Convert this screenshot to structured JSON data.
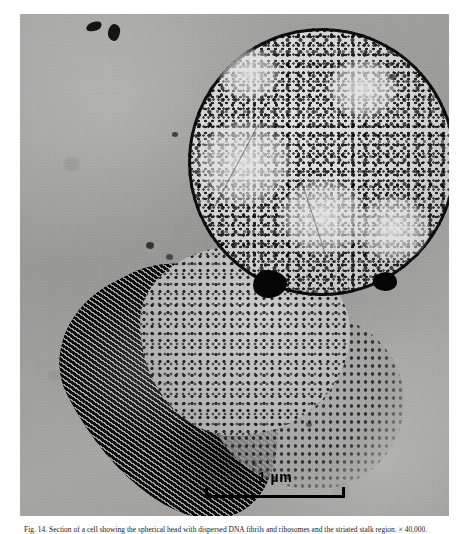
{
  "figure": {
    "kind": "transmission-electron-micrograph",
    "specimen": "thin-sectioned bacterial cell with spherical head and elongated stalk",
    "background_tone": "#9b9b99",
    "membrane_color": "#111111",
    "inclusion_color": "#0a0a0a"
  },
  "scale_bar": {
    "label": "1 µm",
    "value": 1,
    "unit": "µm",
    "length_px": 140,
    "position": "bottom-center"
  },
  "caption": {
    "visible": true,
    "clipped": true,
    "note": "caption line is cut off by the bottom edge of the image; only the tops of the glyphs are rendered",
    "text": "Fig. 14. Section of a cell showing the spherical head with dispersed DNA fibrils and ribosomes and the striated stalk region.  × 40,000.",
    "fig_number": "Fig. 14."
  },
  "debris": [
    {
      "name": "fleck-upper-left-a",
      "x": 66,
      "y": 8,
      "w": 16,
      "h": 9
    },
    {
      "name": "fleck-upper-left-b",
      "x": 88,
      "y": 10,
      "w": 12,
      "h": 16
    }
  ],
  "structures": [
    {
      "name": "spherical-head",
      "description": "round cell body with thick dark envelope and granular cytoplasm"
    },
    {
      "name": "stalk-lobe",
      "description": "dark elongated lobe with diagonal lamellar striations"
    },
    {
      "name": "neck-region",
      "description": "granular junction between head and stalk"
    },
    {
      "name": "inclusion-granule-large",
      "description": "electron-dense polyphosphate-like body"
    },
    {
      "name": "inclusion-granule-small",
      "description": "second smaller electron-dense body"
    }
  ]
}
